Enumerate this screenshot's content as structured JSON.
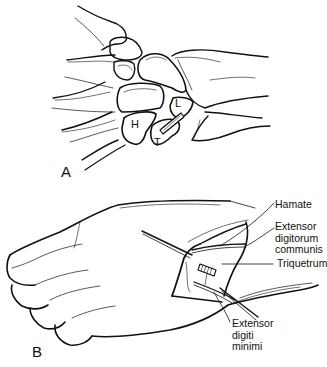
{
  "panels": {
    "a": {
      "letter": "A",
      "bone_labels": {
        "hamate": "H",
        "triquetrum": "T",
        "lunate": "L"
      }
    },
    "b": {
      "letter": "B",
      "callouts": [
        {
          "id": "hamate",
          "lines": [
            "Hamate"
          ]
        },
        {
          "id": "edc",
          "lines": [
            "Extensor",
            "digitorum",
            "communis"
          ]
        },
        {
          "id": "triquetrum",
          "lines": [
            "Triquetrum"
          ]
        },
        {
          "id": "edm",
          "lines": [
            "Extensor",
            "digiti",
            "minimi"
          ]
        }
      ]
    }
  },
  "colors": {
    "ink": "#111111",
    "background": "#ffffff"
  }
}
